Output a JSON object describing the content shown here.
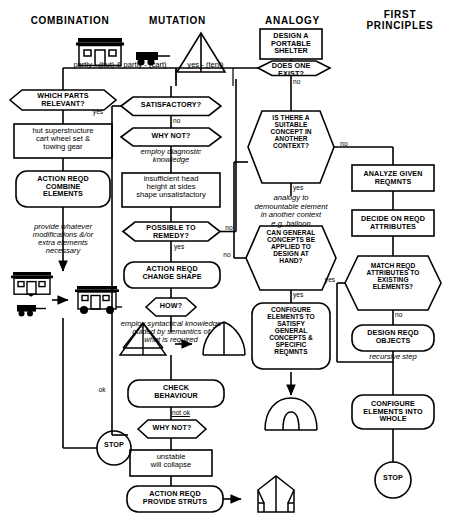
{
  "diagram": {
    "stroke_color": "#000000",
    "background": "#ffffff",
    "columns": [
      {
        "id": "combination",
        "label": "COMBINATION"
      },
      {
        "id": "mutation",
        "label": "MUTATION"
      },
      {
        "id": "analogy",
        "label": "ANALOGY"
      },
      {
        "id": "first_principles",
        "label": "FIRST\nPRINCIPLES"
      }
    ]
  },
  "icons": {
    "hut": "hut-icon",
    "cart": "cart-icon",
    "a_frame_tent": "a-frame-tent-icon",
    "hut_on_wheels": "hut-on-wheels-icon",
    "plus": "+",
    "strutted_tent": "strutted-tent-icon",
    "curved_tent": "curved-tent-icon",
    "dome_tent": "dome-tent-icon",
    "ridge_tent": "ridge-tent-icon"
  },
  "nodes": {
    "design_shelter": "DESIGN A\nPORTABLE\nSHELTER",
    "does_one_exist": "DOES ONE\nEXIST?",
    "which_parts": "WHICH PARTS\nRELEVANT?",
    "hut_super": "hut superstructure\ncart wheel set &\ntowing gear",
    "action_combine": "ACTION REQD\nCOMBINE\nELEMENTS",
    "satisfactory": "SATISFACTORY?",
    "why_not_1": "WHY NOT?",
    "insufficient": "insufficient head\nheight at sides\nshape unsatisfactory",
    "possible_remedy": "POSSIBLE TO\nREMEDY?",
    "action_change_shape": "ACTION REQD\nCHANGE SHAPE",
    "how": "HOW?",
    "check_behaviour": "CHECK\nBEHAVIOUR",
    "why_not_2": "WHY NOT?",
    "unstable": "unstable\nwill collapse",
    "action_struts": "ACTION REQD\nPROVIDE STRUTS",
    "stop_left": "STOP",
    "suitable_concept": "IS THERE A\nSUITABLE\nCONCEPT IN\nANOTHER\nCONTEXT?",
    "can_general": "CAN GENERAL\nCONCEPTS BE\nAPPLIED TO\nDESIGN AT\nHAND?",
    "configure_satisfy": "CONFIGURE\nELEMENTS TO\nSATISFY\nGENERAL\nCONCEPTS &\nSPECIFIC\nREQMNTS",
    "analyze_reqmnts": "ANALYZE GIVEN\nREQMNTS",
    "decide_attributes": "DECIDE ON REQD\nATTRIBUTES",
    "match_reqd": "MATCH REQD\nATTRIBUTES TO\nEXISTING\nELEMENTS?",
    "design_objects": "DESIGN REQD\nOBJECTS",
    "configure_whole": "CONFIGURE\nELEMENTS INTO\nWHOLE",
    "stop_right": "STOP"
  },
  "annotations": {
    "partly_hut_cart": "partly - (hut)  &  partly - (cart)",
    "yes_tent": "yes - (tent)",
    "provide_whatever": "provide whatever\nmodifications &/or\nextra elements\nnecessary",
    "employ_diagnostic": "employ diagnostic\nknowledge",
    "employ_syntactical": "employ syntactical knowledge\nguided by semantics of\nwhat is required",
    "analogy_to": "analogy to\ndemountable element\nin another context\ne.g. balloon",
    "recursive_step": "recursive step"
  },
  "edge_labels": {
    "no_exist": "no",
    "no_satisfactory": "no",
    "yes_satisfactory": "yes",
    "no_remedy": "no",
    "yes_remedy": "yes",
    "no_suitable": "no",
    "yes_suitable": "yes",
    "no_can_general": "no",
    "yes_can_general": "yes",
    "ok_check": "ok",
    "not_ok_check": "not ok",
    "yes_match": "yes",
    "no_match": "no"
  }
}
